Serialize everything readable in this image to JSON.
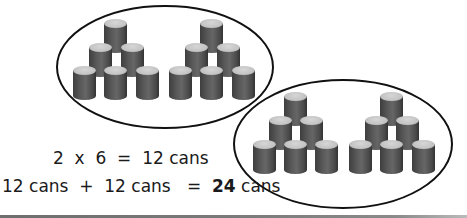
{
  "figure": {
    "groups": [
      {
        "name": "group-1",
        "ellipse": {
          "cx": 165,
          "cy": 67,
          "rx": 108,
          "ry": 61
        },
        "pyramids": [
          {
            "cans": [
              [
                104,
                19
              ],
              [
                89,
                43
              ],
              [
                121,
                43
              ],
              [
                73,
                66
              ],
              [
                104,
                66
              ],
              [
                136,
                66
              ]
            ]
          },
          {
            "cans": [
              [
                200,
                19
              ],
              [
                185,
                43
              ],
              [
                217,
                43
              ],
              [
                169,
                66
              ],
              [
                200,
                66
              ],
              [
                232,
                66
              ]
            ]
          }
        ]
      },
      {
        "name": "group-2",
        "ellipse": {
          "cx": 343,
          "cy": 144,
          "rx": 109,
          "ry": 64
        },
        "pyramids": [
          {
            "cans": [
              [
                284,
                92
              ],
              [
                269,
                116
              ],
              [
                300,
                116
              ],
              [
                253,
                140
              ],
              [
                284,
                140
              ],
              [
                315,
                140
              ]
            ]
          },
          {
            "cans": [
              [
                380,
                92
              ],
              [
                365,
                116
              ],
              [
                396,
                116
              ],
              [
                349,
                140
              ],
              [
                380,
                140
              ],
              [
                412,
                140
              ]
            ]
          }
        ]
      }
    ],
    "colors": {
      "ellipse_stroke": "#111111",
      "can_body": "#555555",
      "can_top": "#c8c8c8",
      "text": "#1a1a1a",
      "bottom_bar": "#777777"
    }
  },
  "equations": {
    "line1": "2  x  6  =  12 cans",
    "line2_prefix": "12 cans  +  12 cans   =  ",
    "line2_result": "24",
    "line2_suffix": " cans"
  }
}
